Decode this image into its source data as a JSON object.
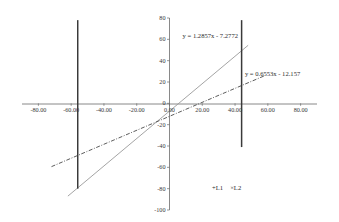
{
  "chart_data": {
    "type": "scatter",
    "title": "",
    "xlabel": "",
    "ylabel": "",
    "xlim": [
      -90,
      90
    ],
    "ylim": [
      -100,
      80
    ],
    "grid": false,
    "legend_position": "bottom-right",
    "x_ticks": [
      {
        "value": -80,
        "label": "-80.00"
      },
      {
        "value": -60,
        "label": "-60.00"
      },
      {
        "value": -40,
        "label": "-40.00"
      },
      {
        "value": -20,
        "label": "-20.00"
      },
      {
        "value": 0,
        "label": "0.00"
      },
      {
        "value": 20,
        "label": "20.00"
      },
      {
        "value": 40,
        "label": "40.00"
      },
      {
        "value": 60,
        "label": "60.00"
      },
      {
        "value": 80,
        "label": "80.00"
      }
    ],
    "y_ticks": [
      {
        "value": 80,
        "label": "80"
      },
      {
        "value": 60,
        "label": "60"
      },
      {
        "value": 40,
        "label": "40"
      },
      {
        "value": 20,
        "label": "20"
      },
      {
        "value": 0,
        "label": "0"
      },
      {
        "value": -20,
        "label": "-20"
      },
      {
        "value": -40,
        "label": "-40"
      },
      {
        "value": -60,
        "label": "-60"
      },
      {
        "value": -80,
        "label": "-80"
      },
      {
        "value": -100,
        "label": "-100"
      }
    ],
    "series": [
      {
        "name": "L1",
        "marker": "+",
        "style": "solid",
        "color": "#9a9a9a",
        "equation": "y = 1.2857x - 7.2772",
        "slope": 1.2857,
        "intercept": -7.2772,
        "x_range": [
          -62,
          48
        ]
      },
      {
        "name": "L2",
        "marker": "×",
        "style": "dash-dot",
        "color": "#4a4a4a",
        "equation": "y = 0.6553x - 12.157",
        "slope": 0.6553,
        "intercept": -12.157,
        "x_range": [
          -72,
          58
        ]
      }
    ],
    "data_bars": [
      {
        "name": "bar-left",
        "x": -56,
        "y_top": 78,
        "y_bottom": -80,
        "color": "#3a3a3a"
      },
      {
        "name": "bar-right",
        "x": 44,
        "y_top": 78,
        "y_bottom": -41,
        "color": "#3a3a3a"
      }
    ],
    "annotations": [
      {
        "id": "eq1",
        "text": "y = 1.2857x - 7.2772",
        "x": 8,
        "y": 62
      },
      {
        "id": "eq2",
        "text": "y = 0.6553x - 12.157",
        "x": 46,
        "y": 27
      }
    ],
    "legend": {
      "entries": [
        {
          "marker": "+",
          "label": "L1"
        },
        {
          "marker": "×",
          "label": "L2"
        }
      ],
      "entry1_text": "+L1",
      "entry2_text": "×L2"
    },
    "colors": {
      "axis": "#6b6b6b",
      "line_solid": "#9a9a9a",
      "line_dashdot": "#4a4a4a",
      "bar": "#3a3a3a",
      "text": "#2b2b2b",
      "background": "#ffffff"
    }
  }
}
